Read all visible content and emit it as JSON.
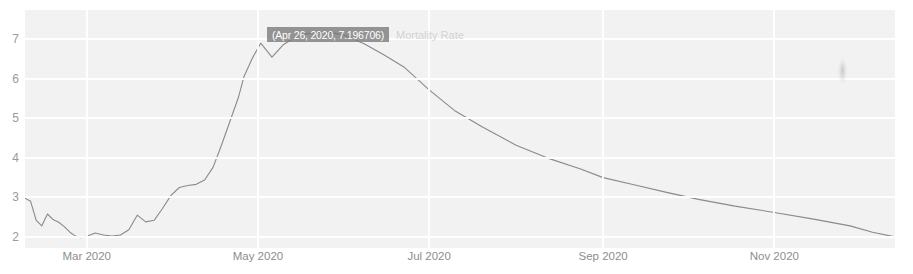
{
  "chart_data": {
    "type": "line",
    "title": "",
    "xlabel": "",
    "ylabel": "",
    "series_name": "Mortality Rate",
    "grid": true,
    "legend_position": "inline-right-of-tooltip",
    "ylim": [
      1.72,
      7.74
    ],
    "y_ticks": [
      "7",
      "6",
      "5",
      "4",
      "3",
      "2"
    ],
    "y_tick_values": [
      7,
      6,
      5,
      4,
      3,
      2
    ],
    "x_ticks": [
      "Mar 2020",
      "May 2020",
      "Jul 2020",
      "Sep 2020",
      "Nov 2020"
    ],
    "x_tick_values": [
      "2020-03-01",
      "2020-05-01",
      "2020-07-01",
      "2020-09-01",
      "2020-11-01"
    ],
    "xlim": [
      "2020-02-08",
      "2020-12-14"
    ],
    "line_color": "#8a8a8a",
    "plot_background": "#f2f2f2",
    "gridline_color": "#ffffff",
    "annotation": {
      "label": "(Apr 26, 2020, 7.196706)",
      "date": "Apr 26, 2020",
      "value": 7.196706
    },
    "x": [
      "2020-02-08",
      "2020-02-10",
      "2020-02-12",
      "2020-02-14",
      "2020-02-16",
      "2020-02-18",
      "2020-02-20",
      "2020-02-22",
      "2020-02-24",
      "2020-02-26",
      "2020-02-28",
      "2020-03-01",
      "2020-03-04",
      "2020-03-07",
      "2020-03-10",
      "2020-03-13",
      "2020-03-16",
      "2020-03-19",
      "2020-03-22",
      "2020-03-25",
      "2020-03-28",
      "2020-03-31",
      "2020-04-03",
      "2020-04-06",
      "2020-04-09",
      "2020-04-12",
      "2020-04-15",
      "2020-04-18",
      "2020-04-21",
      "2020-04-24",
      "2020-04-26",
      "2020-04-29",
      "2020-05-02",
      "2020-05-06",
      "2020-05-10",
      "2020-05-15",
      "2020-05-20",
      "2020-05-25",
      "2020-06-01",
      "2020-06-08",
      "2020-06-15",
      "2020-06-22",
      "2020-07-01",
      "2020-07-10",
      "2020-07-20",
      "2020-08-01",
      "2020-08-12",
      "2020-08-24",
      "2020-09-01",
      "2020-09-12",
      "2020-09-24",
      "2020-10-05",
      "2020-10-18",
      "2020-11-01",
      "2020-11-15",
      "2020-11-28",
      "2020-12-06",
      "2020-12-14"
    ],
    "values": [
      2.98,
      2.9,
      2.42,
      2.28,
      2.58,
      2.44,
      2.37,
      2.26,
      2.12,
      2.02,
      1.98,
      2.02,
      2.1,
      2.05,
      2.02,
      2.05,
      2.18,
      2.55,
      2.38,
      2.42,
      2.72,
      3.05,
      3.25,
      3.3,
      3.33,
      3.44,
      3.76,
      4.32,
      4.92,
      5.52,
      6.05,
      6.52,
      6.9,
      6.55,
      6.86,
      7.08,
      7.16,
      7.2,
      7.1,
      6.88,
      6.6,
      6.3,
      5.72,
      5.2,
      4.78,
      4.32,
      4.0,
      3.72,
      3.5,
      3.32,
      3.12,
      2.95,
      2.78,
      2.62,
      2.45,
      2.28,
      2.12,
      2.0
    ]
  },
  "annotation_tooltip": {
    "text": "(Apr 26, 2020, 7.196706)"
  },
  "legend": {
    "series_label": "Mortality Rate"
  }
}
